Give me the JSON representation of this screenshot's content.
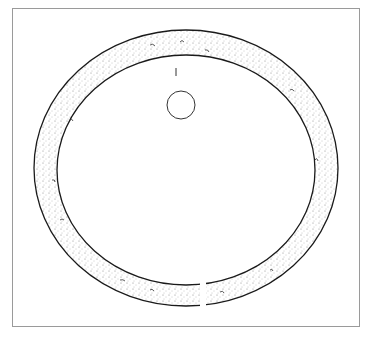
{
  "figure": {
    "section_label": "",
    "colors": {
      "frame": "#9a9a9a",
      "ink": "#1a1a1a",
      "stipple": "#555555",
      "paper": "#ffffff"
    }
  }
}
